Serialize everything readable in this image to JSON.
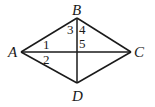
{
  "diagram": {
    "type": "rhombus-with-diagonals",
    "vertices": [
      {
        "id": "A",
        "label": "A",
        "x": 21,
        "y": 52
      },
      {
        "id": "B",
        "label": "B",
        "x": 77,
        "y": 18
      },
      {
        "id": "C",
        "label": "C",
        "x": 131,
        "y": 52
      },
      {
        "id": "D",
        "label": "D",
        "x": 77,
        "y": 83
      }
    ],
    "edges": [
      [
        "A",
        "B"
      ],
      [
        "B",
        "C"
      ],
      [
        "C",
        "D"
      ],
      [
        "D",
        "A"
      ]
    ],
    "diagonals": [
      [
        "A",
        "C"
      ],
      [
        "B",
        "D"
      ]
    ],
    "angle_labels": [
      {
        "id": "1",
        "label": "1"
      },
      {
        "id": "2",
        "label": "2"
      },
      {
        "id": "3",
        "label": "3"
      },
      {
        "id": "4",
        "label": "4"
      },
      {
        "id": "5",
        "label": "5"
      }
    ]
  }
}
